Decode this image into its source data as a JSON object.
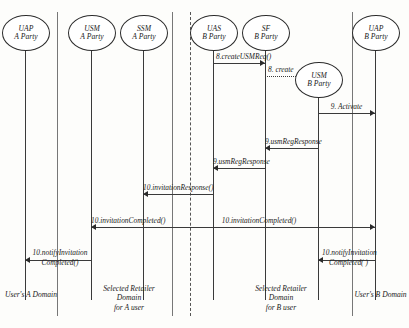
{
  "diagram": {
    "type": "uml-sequence-diagram",
    "actors": [
      {
        "id": "uap-a",
        "line1": "UAP",
        "line2": "A Party",
        "x": 25,
        "cy": 32,
        "rx": 23,
        "ry": 17,
        "lifeline_top": 49,
        "lifeline_bottom": 300
      },
      {
        "id": "usm-a",
        "line1": "USM",
        "line2": "A Party",
        "x": 91,
        "cy": 32,
        "rx": 23,
        "ry": 17,
        "lifeline_top": 49,
        "lifeline_bottom": 300
      },
      {
        "id": "ssm-a",
        "line1": "SSM",
        "line2": "A Party",
        "x": 143,
        "cy": 32,
        "rx": 23,
        "ry": 17,
        "lifeline_top": 49,
        "lifeline_bottom": 300
      },
      {
        "id": "uas-b",
        "line1": "UAS",
        "line2": "B Party",
        "x": 213,
        "cy": 32,
        "rx": 23,
        "ry": 17,
        "lifeline_top": 49,
        "lifeline_bottom": 300
      },
      {
        "id": "sf-b",
        "line1": "SF",
        "line2": "B Party",
        "x": 265,
        "cy": 32,
        "rx": 23,
        "ry": 17,
        "lifeline_top": 49,
        "lifeline_bottom": 300
      },
      {
        "id": "usm-b",
        "line1": "USM",
        "line2": "B Party",
        "x": 318,
        "cy": 79,
        "rx": 23,
        "ry": 17,
        "lifeline_top": 96,
        "lifeline_bottom": 300
      },
      {
        "id": "uap-b",
        "line1": "UAP",
        "line2": "B Party",
        "x": 375,
        "cy": 32,
        "rx": 23,
        "ry": 17,
        "lifeline_top": 49,
        "lifeline_bottom": 300
      }
    ],
    "messages": [
      {
        "id": "m1",
        "label": "8.createUSMReq()",
        "from": "uas-b",
        "to": "sf-b",
        "y": 63,
        "style": "solid",
        "dir": "right",
        "label_align": "left"
      },
      {
        "id": "m2",
        "label": "8. create",
        "from": "sf-b",
        "to": "usm-b",
        "y": 76,
        "style": "dotted",
        "dir": "right",
        "label_align": "left"
      },
      {
        "id": "m3",
        "label": "9. Activate",
        "from": "usm-b",
        "to": "uap-b",
        "y": 113,
        "style": "solid",
        "dir": "right",
        "label_align": "center"
      },
      {
        "id": "m4",
        "label": "9.usmRegResponse",
        "from": "usm-b",
        "to": "sf-b",
        "y": 148,
        "style": "solid",
        "dir": "left",
        "label_align": "center"
      },
      {
        "id": "m5",
        "label": "9.usmRegResponse",
        "from": "sf-b",
        "to": "uas-b",
        "y": 168,
        "style": "solid",
        "dir": "left",
        "label_align": "center"
      },
      {
        "id": "m6",
        "label": "10.invitationResponse()",
        "from": "uas-b",
        "to": "ssm-a",
        "y": 194,
        "style": "solid",
        "dir": "left",
        "label_align": "center"
      },
      {
        "id": "m7",
        "label": "10.invitationCompleted()",
        "from": "ssm-a",
        "to": "usm-a",
        "y": 227,
        "style": "solid",
        "dir": "left",
        "label_align": "center"
      },
      {
        "id": "m8",
        "label": "10.invitationCompleted()",
        "from": "ssm-a",
        "to": "uap-b",
        "y": 227,
        "style": "solid",
        "dir": "right",
        "label_align": "center"
      },
      {
        "id": "m9",
        "label_line1": "10.notifyInvitation",
        "label_line2": "Completed()",
        "from": "usm-a",
        "to": "uap-a",
        "y": 260,
        "style": "solid",
        "dir": "left",
        "label_align": "center"
      },
      {
        "id": "m10",
        "label_line1": "10.notifyInvitation",
        "label_line2": "Completed( )",
        "from": "uap-b",
        "to": "usm-b",
        "y": 260,
        "style": "solid",
        "dir": "left",
        "label_align": "center"
      }
    ],
    "dividers": [
      {
        "id": "div-a-left",
        "x": 57,
        "top": 12,
        "bottom": 316,
        "style": "solid"
      },
      {
        "id": "div-a-right",
        "x": 172,
        "top": 12,
        "bottom": 316,
        "style": "solid"
      },
      {
        "id": "div-center",
        "x": 190,
        "top": 12,
        "bottom": 316,
        "style": "dashed"
      },
      {
        "id": "div-b-right",
        "x": 352,
        "top": 12,
        "bottom": 316,
        "style": "solid"
      }
    ],
    "footers": [
      {
        "id": "footer-a-domain",
        "line1": "User's A Domain",
        "line2": "",
        "line3": "",
        "x": 2,
        "width": 58,
        "y": 290
      },
      {
        "id": "footer-a-retailer",
        "line1": "Selected Retailer",
        "line2": "Domain",
        "line3": "for A user",
        "x": 86,
        "width": 86,
        "y": 284
      },
      {
        "id": "footer-b-retailer",
        "line1": "Selected Retailer",
        "line2": "Domain",
        "line3": "for B user",
        "x": 238,
        "width": 86,
        "y": 284
      },
      {
        "id": "footer-b-domain",
        "line1": "User's B Domain",
        "line2": "",
        "line3": "",
        "x": 352,
        "width": 57,
        "y": 290
      }
    ]
  }
}
